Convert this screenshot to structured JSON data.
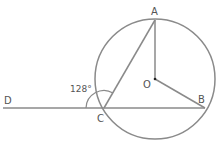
{
  "diagram": {
    "type": "circle-geometry",
    "stroke_color": "#8a8a8a",
    "label_color": "#555555",
    "points": {
      "A": {
        "label": "A"
      },
      "B": {
        "label": "B"
      },
      "C": {
        "label": "C"
      },
      "D": {
        "label": "D"
      },
      "O": {
        "label": "O"
      }
    },
    "angle_label": "128°",
    "segments": [
      "DB",
      "CA",
      "OA",
      "OB"
    ],
    "circle_center": "O"
  }
}
